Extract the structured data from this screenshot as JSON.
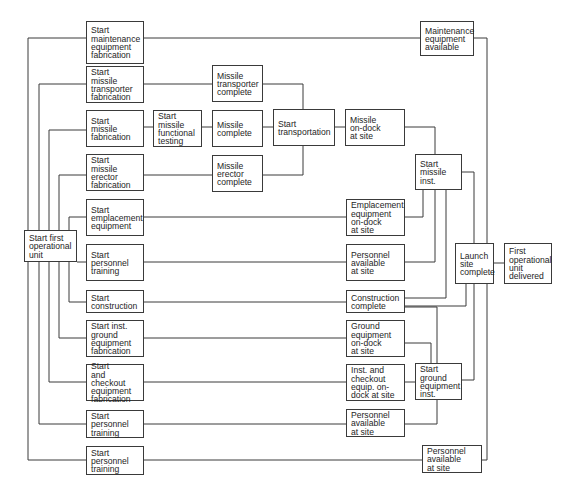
{
  "figure": {
    "caption_fragment": "",
    "line_color": "#3a3a3a",
    "box_border_color": "#3a3a3a",
    "text_color": "#1e1e1e"
  },
  "nodes": {
    "start_first_unit": {
      "label": "Start first\noperational\nunit"
    },
    "start_maint_fab": {
      "label": "Start\nmaintenance\nequipment\nfabrication"
    },
    "maint_available": {
      "label": "Maintenance\nequipment\navailable"
    },
    "start_transporter_fab": {
      "label": "Start\nmissile\ntransporter\nfabrication"
    },
    "transporter_complete": {
      "label": "Missile\ntransporter\ncomplete"
    },
    "start_missile_fab": {
      "label": "Start\nmissile\nfabrication"
    },
    "start_functional_test": {
      "label": "Start\nmissile\nfunctional\ntesting"
    },
    "missile_complete": {
      "label": "Missile\ncomplete"
    },
    "start_transportation": {
      "label": "Start\ntransportation"
    },
    "missile_on_dock": {
      "label": "Missile\non-dock\nat site"
    },
    "start_erector_fab": {
      "label": "Start\nmissile\nerector\nfabrication"
    },
    "erector_complete": {
      "label": "Missile\nerector\ncomplete"
    },
    "start_missile_inst": {
      "label": "Start\nmissile\ninst."
    },
    "start_emplacement": {
      "label": "Start\nemplacement\nequipment"
    },
    "emplacement_on_dock": {
      "label": "Emplacement\nequipment\non-dock\nat site"
    },
    "start_personnel_1": {
      "label": "Start\npersonnel\ntraining"
    },
    "personnel_avail_1": {
      "label": "Personnel\navailable\nat site"
    },
    "launch_site_complete": {
      "label": "Launch\nsite\ncomplete"
    },
    "first_unit_delivered": {
      "label": "First\noperational\nunit\ndelivered"
    },
    "start_construction": {
      "label": "Start\nconstruction"
    },
    "construction_complete": {
      "label": "Construction\ncomplete"
    },
    "start_ground_fab": {
      "label": "Start inst.\nground\nequipment\nfabrication"
    },
    "ground_on_dock": {
      "label": "Ground\nequipment\non-dock\nat site"
    },
    "start_checkout_fab": {
      "label": "Start\nand checkout\nequipment\nfabrication"
    },
    "checkout_on_dock": {
      "label": "Inst. and\ncheckout\nequip. on-\ndock at site"
    },
    "start_ground_inst": {
      "label": "Start\nground\nequipment\ninst."
    },
    "start_personnel_2": {
      "label": "Start\npersonnel\ntraining"
    },
    "personnel_avail_2": {
      "label": "Personnel\navailable\nat site"
    },
    "start_personnel_3": {
      "label": "Start\npersonnel\ntraining"
    },
    "personnel_avail_3": {
      "label": "Personnel\navailable\nat site"
    }
  }
}
